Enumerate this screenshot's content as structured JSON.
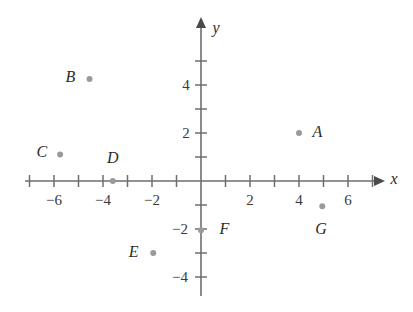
{
  "chart_data": {
    "type": "scatter",
    "title": "",
    "xlabel": "x",
    "ylabel": "y",
    "xlim": [
      -7.2,
      7.2
    ],
    "ylim": [
      -4.8,
      5.4
    ],
    "grid": false,
    "legend": "none",
    "axis_style": "arrows-both-ends-positive",
    "xticks": [
      -7,
      -6,
      -5,
      -4,
      -3,
      -2,
      -1,
      1,
      2,
      3,
      4,
      5,
      6,
      7
    ],
    "yticks": [
      -4,
      -3,
      -2,
      -1,
      1,
      2,
      3,
      4,
      5
    ],
    "xtick_labels": [
      {
        "value": -6,
        "text": "−6"
      },
      {
        "value": -4,
        "text": "−4"
      },
      {
        "value": -2,
        "text": "−2"
      },
      {
        "value": 2,
        "text": "2"
      },
      {
        "value": 4,
        "text": "4"
      },
      {
        "value": 6,
        "text": "6"
      }
    ],
    "ytick_labels": [
      {
        "value": 4,
        "text": "4"
      },
      {
        "value": 2,
        "text": "2"
      },
      {
        "value": -2,
        "text": "−2"
      },
      {
        "value": -4,
        "text": "−4"
      }
    ],
    "points": [
      {
        "label": "A",
        "x": 4.0,
        "y": 2.0,
        "label_dx": 0.75,
        "label_dy": 0.05
      },
      {
        "label": "B",
        "x": -4.55,
        "y": 4.25,
        "label_dx": -0.78,
        "label_dy": 0.1
      },
      {
        "label": "C",
        "x": -5.75,
        "y": 1.1,
        "label_dx": -0.75,
        "label_dy": 0.1
      },
      {
        "label": "D",
        "x": -3.6,
        "y": 0.0,
        "label_dx": 0.0,
        "label_dy": 0.95
      },
      {
        "label": "E",
        "x": -1.95,
        "y": -3.0,
        "label_dx": -0.8,
        "label_dy": 0.05
      },
      {
        "label": "F",
        "x": 0.0,
        "y": -2.05,
        "label_dx": 0.95,
        "label_dy": 0.05
      },
      {
        "label": "G",
        "x": 4.95,
        "y": -1.05,
        "label_dx": -0.05,
        "label_dy": -0.95
      }
    ]
  },
  "colors": {
    "background": "#ffffff",
    "axis": "#6e6e6e",
    "arrow": "#4a4a4a",
    "point": "#9a9a9a",
    "label_text": "#2b2b2b",
    "tick_text": "#3a3a3a"
  }
}
